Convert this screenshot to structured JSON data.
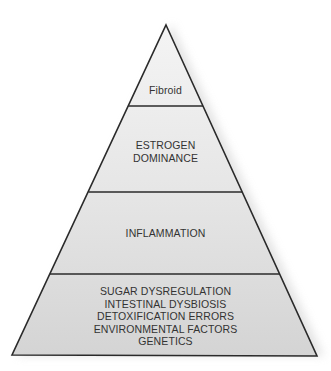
{
  "diagram": {
    "type": "pyramid",
    "levels": [
      {
        "id": "fibroid",
        "lines": [
          "Fibroid"
        ]
      },
      {
        "id": "estrogen-dominance",
        "lines": [
          "ESTROGEN",
          "DOMINANCE"
        ]
      },
      {
        "id": "inflammation",
        "lines": [
          "INFLAMMATION"
        ]
      },
      {
        "id": "root-causes",
        "lines": [
          "SUGAR DYSREGULATION",
          "INTESTINAL DYSBIOSIS",
          "DETOXIFICATION ERRORS",
          "ENVIRONMENTAL FACTORS",
          "GENETICS"
        ]
      }
    ],
    "colors": {
      "outline": "#2a2a2a",
      "fill_top": "#f3f3f3",
      "fill_bottom": "#d6d6d6",
      "text": "#333333",
      "shadow": "#c8c8c8"
    }
  }
}
